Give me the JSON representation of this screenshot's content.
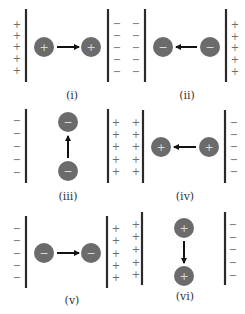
{
  "figure": {
    "colors": {
      "plate": "#2a2a2a",
      "charge": "#6b6b6b",
      "arrow": "#111111",
      "sign": "#6e6e6e"
    },
    "panels": [
      {
        "id": "i",
        "label": "(i)",
        "left_signs": [
          "+",
          "+",
          "+",
          "+",
          "+"
        ],
        "right_signs": [
          "−",
          "−",
          "−",
          "−",
          "−"
        ],
        "charge": "+",
        "motion": "right"
      },
      {
        "id": "ii",
        "label": "(ii)",
        "left_signs": [
          "−",
          "−",
          "−",
          "−",
          "−"
        ],
        "right_signs": [
          "+",
          "+",
          "+",
          "+",
          "+"
        ],
        "charge": "−",
        "motion": "left"
      },
      {
        "id": "iii",
        "label": "(iii)",
        "left_signs": [
          "−",
          "−",
          "−",
          "−",
          "−"
        ],
        "right_signs": [
          "+",
          "+",
          "+",
          "+",
          "+"
        ],
        "charge": "−",
        "motion": "up"
      },
      {
        "id": "iv",
        "label": "(iv)",
        "left_signs": [
          "+",
          "+",
          "+",
          "+",
          "+"
        ],
        "right_signs": [
          "−",
          "−",
          "−",
          "−",
          "−"
        ],
        "charge": "+",
        "motion": "left"
      },
      {
        "id": "v",
        "label": "(v)",
        "left_signs": [
          "−",
          "−",
          "−",
          "−",
          "−"
        ],
        "right_signs": [
          "+",
          "+",
          "+",
          "+",
          "+"
        ],
        "charge": "−",
        "motion": "right"
      },
      {
        "id": "vi",
        "label": "(vi)",
        "left_signs": [
          "+",
          "+",
          "+",
          "+",
          "+"
        ],
        "right_signs": [
          "−",
          "−",
          "−",
          "−",
          "−"
        ],
        "charge": "+",
        "motion": "down"
      }
    ]
  }
}
